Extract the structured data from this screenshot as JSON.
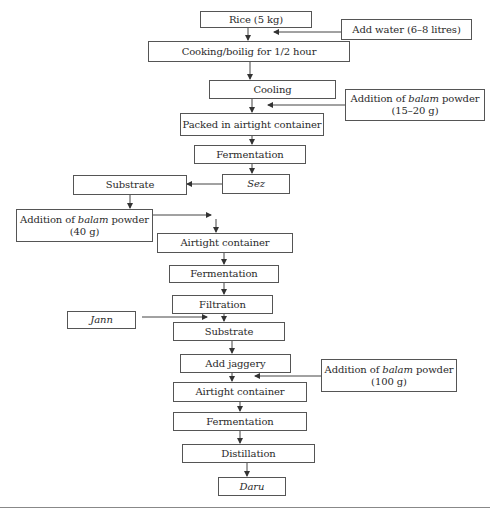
{
  "diagram": {
    "type": "flowchart",
    "main_flow": [
      {
        "id": "rice",
        "label": "Rice (5 kg)"
      },
      {
        "id": "cooking",
        "label": "Cooking/boilig for 1/2 hour"
      },
      {
        "id": "cooling",
        "label": "Cooling"
      },
      {
        "id": "packed",
        "label": "Packed in airtight container"
      },
      {
        "id": "fermentation1",
        "label": "Fermentation"
      },
      {
        "id": "sez",
        "label": "Sez"
      },
      {
        "id": "substrate1",
        "label": "Substrate"
      },
      {
        "id": "airtight1",
        "label": "Airtight container"
      },
      {
        "id": "fermentation2",
        "label": "Fermentation"
      },
      {
        "id": "filtration",
        "label": "Filtration"
      },
      {
        "id": "substrate2",
        "label": "Substrate"
      },
      {
        "id": "jaggery",
        "label": "Add jaggery"
      },
      {
        "id": "airtight2",
        "label": "Airtight container"
      },
      {
        "id": "fermentation3",
        "label": "Fermentation"
      },
      {
        "id": "distillation",
        "label": "Distillation"
      },
      {
        "id": "daru",
        "label": "Daru"
      }
    ],
    "inputs": {
      "water": {
        "label": "Add water (6–8 litres)"
      },
      "balam1": {
        "prefix": "Addition of ",
        "italic": "balam",
        "suffix": " powder",
        "line2": "(15–20 g)"
      },
      "balam2": {
        "prefix": "Addition of ",
        "italic": "balam",
        "suffix": " powder",
        "line2": "(40 g)"
      },
      "jann": {
        "label": "Jann"
      },
      "balam3": {
        "prefix": "Addition of ",
        "italic": "balam",
        "suffix": " powder",
        "line2": "(100 g)"
      }
    },
    "colors": {
      "line": "#555555",
      "text": "#2a2a2a",
      "background": "#ffffff"
    }
  }
}
